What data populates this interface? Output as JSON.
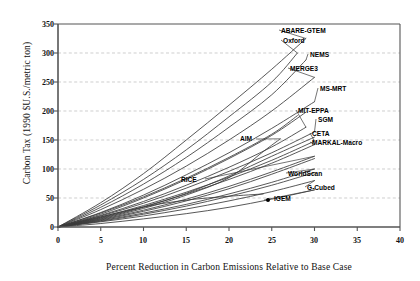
{
  "chart_data": {
    "type": "line",
    "title": "",
    "xlabel": "Percent Reduction in Carbon Emissions Relative to Base Case",
    "ylabel": "Carbon Tax (1990 $U.S./metric ton)",
    "xlim": [
      0,
      40
    ],
    "ylim": [
      0,
      350
    ],
    "xticks": [
      "0",
      "5",
      "10",
      "15",
      "20",
      "25",
      "30",
      "35",
      "40"
    ],
    "yticks": [
      "0",
      "50",
      "100",
      "150",
      "200",
      "250",
      "300",
      "350"
    ],
    "grid": "horizontal-dashed",
    "legend": "inline-end-labels",
    "series": [
      {
        "name": "ABARE-GTEM",
        "label": "ABARE-GTEM",
        "points": [
          [
            0,
            0
          ],
          [
            5,
            42
          ],
          [
            10,
            92
          ],
          [
            15,
            150
          ],
          [
            20,
            210
          ],
          [
            25,
            272
          ],
          [
            29,
            325
          ]
        ]
      },
      {
        "name": "Oxford",
        "label": "Oxford",
        "points": [
          [
            0,
            0
          ],
          [
            5,
            38
          ],
          [
            10,
            82
          ],
          [
            15,
            133
          ],
          [
            20,
            190
          ],
          [
            25,
            250
          ],
          [
            28,
            300
          ]
        ]
      },
      {
        "name": "NEMS",
        "label": "NEMS",
        "points": [
          [
            0,
            0
          ],
          [
            5,
            34
          ],
          [
            10,
            74
          ],
          [
            15,
            120
          ],
          [
            20,
            172
          ],
          [
            25,
            228
          ],
          [
            29,
            288
          ]
        ]
      },
      {
        "name": "MERGE3",
        "label": "MERGE3",
        "points": [
          [
            0,
            0
          ],
          [
            5,
            30
          ],
          [
            10,
            65
          ],
          [
            15,
            105
          ],
          [
            20,
            150
          ],
          [
            25,
            200
          ],
          [
            30,
            258
          ]
        ]
      },
      {
        "name": "MS-MRT",
        "label": "MS-MRT",
        "points": [
          [
            0,
            0
          ],
          [
            5,
            25
          ],
          [
            10,
            55
          ],
          [
            15,
            90
          ],
          [
            20,
            128
          ],
          [
            25,
            170
          ],
          [
            30,
            216
          ]
        ]
      },
      {
        "name": "MIT-EPPA",
        "label": "MIT-EPPA",
        "points": [
          [
            0,
            0
          ],
          [
            5,
            20
          ],
          [
            10,
            44
          ],
          [
            15,
            72
          ],
          [
            20,
            103
          ],
          [
            25,
            138
          ],
          [
            29,
            172
          ]
        ]
      },
      {
        "name": "SGM",
        "label": "SGM",
        "points": [
          [
            0,
            0
          ],
          [
            5,
            19
          ],
          [
            10,
            41
          ],
          [
            15,
            67
          ],
          [
            20,
            96
          ],
          [
            25,
            128
          ],
          [
            30,
            164
          ]
        ]
      },
      {
        "name": "CETA",
        "label": "CETA",
        "points": [
          [
            0,
            0
          ],
          [
            5,
            17
          ],
          [
            10,
            37
          ],
          [
            15,
            60
          ],
          [
            20,
            86
          ],
          [
            25,
            115
          ],
          [
            30,
            148
          ]
        ]
      },
      {
        "name": "MARKAL-Macro",
        "label": "MARKAL-Macro",
        "points": [
          [
            0,
            0
          ],
          [
            5,
            16
          ],
          [
            10,
            35
          ],
          [
            15,
            57
          ],
          [
            20,
            82
          ],
          [
            25,
            110
          ],
          [
            30,
            142
          ]
        ]
      },
      {
        "name": "AIM",
        "label": "AIM",
        "points": [
          [
            0,
            0
          ],
          [
            5,
            14
          ],
          [
            10,
            32
          ],
          [
            15,
            55
          ],
          [
            20,
            85
          ],
          [
            24,
            130
          ],
          [
            26,
            152
          ]
        ]
      },
      {
        "name": "RICE",
        "label": "RICE",
        "points": [
          [
            0,
            0
          ],
          [
            5,
            13
          ],
          [
            10,
            29
          ],
          [
            15,
            48
          ],
          [
            20,
            70
          ],
          [
            25,
            95
          ],
          [
            30,
            122
          ]
        ]
      },
      {
        "name": "WorldScan",
        "label": "WorldScan",
        "points": [
          [
            0,
            0
          ],
          [
            5,
            11
          ],
          [
            10,
            24
          ],
          [
            15,
            39
          ],
          [
            20,
            57
          ],
          [
            25,
            77
          ],
          [
            30,
            100
          ]
        ]
      },
      {
        "name": "G-Cubed",
        "label": "G-Cubed",
        "points": [
          [
            0,
            0
          ],
          [
            5,
            9
          ],
          [
            10,
            19
          ],
          [
            15,
            31
          ],
          [
            20,
            45
          ],
          [
            25,
            61
          ],
          [
            30,
            80
          ]
        ]
      },
      {
        "name": "IGEM",
        "label": "IGEM",
        "points": [
          [
            0,
            0
          ],
          [
            5,
            6
          ],
          [
            10,
            14
          ],
          [
            15,
            23
          ],
          [
            20,
            34
          ],
          [
            25,
            48
          ],
          [
            30,
            64
          ]
        ]
      },
      {
        "name": "unlabeled-a",
        "label": "",
        "points": [
          [
            0,
            0
          ],
          [
            5,
            22
          ],
          [
            10,
            50
          ],
          [
            15,
            82
          ],
          [
            20,
            118
          ],
          [
            25,
            158
          ],
          [
            29,
            198
          ]
        ]
      },
      {
        "name": "unlabeled-b",
        "label": "",
        "points": [
          [
            0,
            0
          ],
          [
            5,
            15
          ],
          [
            10,
            34
          ],
          [
            15,
            58
          ],
          [
            20,
            88
          ],
          [
            25,
            122
          ],
          [
            30,
            155
          ]
        ]
      },
      {
        "name": "unlabeled-c",
        "label": "",
        "points": [
          [
            0,
            0
          ],
          [
            5,
            12
          ],
          [
            10,
            27
          ],
          [
            15,
            45
          ],
          [
            20,
            66
          ],
          [
            25,
            91
          ],
          [
            30,
            118
          ]
        ]
      },
      {
        "name": "unlabeled-d",
        "label": "",
        "points": [
          [
            0,
            0
          ],
          [
            5,
            10
          ],
          [
            10,
            22
          ],
          [
            15,
            36
          ],
          [
            20,
            53
          ],
          [
            25,
            72
          ],
          [
            30,
            94
          ]
        ]
      },
      {
        "name": "unlabeled-e",
        "label": "",
        "points": [
          [
            0,
            0
          ],
          [
            4,
            14
          ],
          [
            8,
            28
          ],
          [
            12,
            40
          ],
          [
            16,
            48
          ],
          [
            20,
            53
          ],
          [
            24,
            57
          ]
        ]
      },
      {
        "name": "unlabeled-f",
        "label": "",
        "points": [
          [
            0,
            0
          ],
          [
            5,
            24
          ],
          [
            10,
            52
          ],
          [
            15,
            84
          ],
          [
            20,
            120
          ],
          [
            25,
            160
          ],
          [
            28,
            192
          ]
        ]
      }
    ]
  },
  "axes": {
    "y_title": "Carbon Tax (1990 $U.S./metric ton)",
    "x_title": "Percent Reduction in Carbon Emissions Relative to Base Case",
    "y_ticks": [
      "350",
      "300",
      "250",
      "200",
      "150",
      "100",
      "50",
      "0"
    ],
    "x_ticks": [
      "0",
      "5",
      "10",
      "15",
      "20",
      "25",
      "30",
      "35",
      "40"
    ]
  },
  "labels": {
    "abare_gtem": "ABARE-GTEM",
    "oxford": "Oxford",
    "nems": "NEMS",
    "merge3": "MERGE3",
    "ms_mrt": "MS-MRT",
    "mit_eppa": "MIT-EPPA",
    "sgm": "SGM",
    "ceta": "CETA",
    "markal_macro": "MARKAL-Macro",
    "aim": "AIM",
    "rice": "RICE",
    "worldscan": "WorldScan",
    "g_cubed": "G-Cubed",
    "igem": "IGEM"
  },
  "colors": {
    "line": "#3a3a3a",
    "axis": "#555555",
    "grid": "#b9b9b9",
    "text": "#111111",
    "background": "#ffffff"
  }
}
